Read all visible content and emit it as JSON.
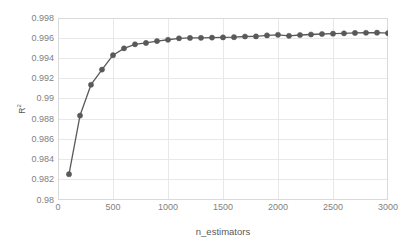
{
  "chart_data": {
    "type": "line",
    "title": "",
    "xlabel": "n_estimators",
    "ylabel": "R²",
    "ylabel_base": "R",
    "ylabel_sup": "2",
    "xlim": [
      0,
      3000
    ],
    "ylim": [
      0.98,
      0.998
    ],
    "xticks": [
      0,
      500,
      1000,
      1500,
      2000,
      2500,
      3000
    ],
    "xtick_labels": [
      "0",
      "500",
      "1000",
      "1500",
      "2000",
      "2500",
      "3000"
    ],
    "yticks": [
      0.98,
      0.982,
      0.984,
      0.986,
      0.988,
      0.99,
      0.992,
      0.994,
      0.996,
      0.998
    ],
    "ytick_labels": [
      "0.98",
      "0.982",
      "0.984",
      "0.986",
      "0.988",
      "0.99",
      "0.992",
      "0.994",
      "0.996",
      "0.998"
    ],
    "grid": "horizontal-and-vertical",
    "legend": "none",
    "series": [
      {
        "name": "R²",
        "color": "#595959",
        "marker": "circle",
        "x": [
          100,
          200,
          300,
          400,
          500,
          600,
          700,
          800,
          900,
          1000,
          1100,
          1200,
          1300,
          1400,
          1500,
          1600,
          1700,
          1800,
          1900,
          2000,
          2100,
          2200,
          2300,
          2400,
          2500,
          2600,
          2700,
          2800,
          2900,
          3000
        ],
        "values": [
          0.98255,
          0.98835,
          0.9914,
          0.9929,
          0.99432,
          0.995,
          0.9954,
          0.99553,
          0.99572,
          0.99585,
          0.99599,
          0.99603,
          0.99604,
          0.99606,
          0.99608,
          0.9961,
          0.99617,
          0.99618,
          0.99628,
          0.99634,
          0.99624,
          0.99632,
          0.99637,
          0.99642,
          0.99645,
          0.99648,
          0.99652,
          0.99654,
          0.99655,
          0.9965
        ]
      }
    ]
  },
  "colors": {
    "series": "#595959",
    "grid": "#e8e8e8",
    "frame": "#d9d9d9",
    "tick_text": "#7f7f7f",
    "title_text": "#595959",
    "background": "#ffffff"
  }
}
